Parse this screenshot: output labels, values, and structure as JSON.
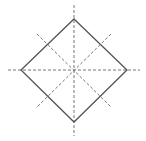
{
  "diagram": {
    "shape": "square",
    "colors": {
      "background": "#ffffff",
      "outline": "#555555",
      "symmetry_lines": "#777777"
    },
    "square_vertices": [
      [
        74,
        19
      ],
      [
        127,
        70
      ],
      [
        74,
        122
      ],
      [
        21,
        70
      ]
    ],
    "center": [
      74,
      70
    ],
    "symmetry_lines": [
      {
        "name": "vertical",
        "from": [
          74,
          5
        ],
        "to": [
          74,
          136
        ]
      },
      {
        "name": "horizontal",
        "from": [
          8,
          70
        ],
        "to": [
          140,
          70
        ]
      },
      {
        "name": "diagonal-down",
        "from": [
          37,
          34
        ],
        "to": [
          111,
          107
        ]
      },
      {
        "name": "diagonal-up",
        "from": [
          111,
          34
        ],
        "to": [
          36,
          108
        ]
      }
    ]
  }
}
